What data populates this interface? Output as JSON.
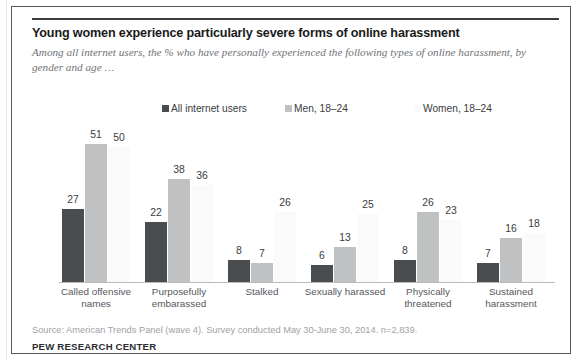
{
  "figure": {
    "title": "Young women experience particularly severe forms of online harassment",
    "subtitle": "Among all internet users, the % who have personally experienced the following types of online harassment, by gender and age …",
    "source": "Source: American Trends Panel (wave 4). Survey conducted May 30-June 30, 2014. n=2,839.",
    "brand": "PEW RESEARCH CENTER"
  },
  "colors": {
    "series_all": "#4a4d50",
    "series_men": "#bfc1c3",
    "series_women": "#fafafa",
    "frame": "#55585c",
    "axis": "#b9bbbd",
    "title_text": "#1a1a1a",
    "subtitle_text": "#6f7276",
    "source_text": "#a0a2a5"
  },
  "chart_data": {
    "type": "bar",
    "title": "Young women experience particularly severe forms of online harassment",
    "subtitle": "Among all internet users, the % who have personally experienced the following types of online harassment, by gender and age …",
    "xlabel": "",
    "ylabel": "",
    "ylim": [
      0,
      58
    ],
    "grid": false,
    "legend_position": "top",
    "categories": [
      "Called offensive names",
      "Purposefully embarassed",
      "Stalked",
      "Sexually harassed",
      "Physically threatened",
      "Sustained harassment"
    ],
    "category_lines": [
      [
        "Called offensive",
        "names"
      ],
      [
        "Purposefully",
        "embarassed"
      ],
      [
        "Stalked"
      ],
      [
        "Sexually harassed"
      ],
      [
        "Physically",
        "threatened"
      ],
      [
        "Sustained",
        "harassment"
      ]
    ],
    "series": [
      {
        "name": "All internet users",
        "color": "#4a4d50",
        "values": [
          27,
          22,
          8,
          6,
          8,
          7
        ]
      },
      {
        "name": "Men, 18–24",
        "color": "#bfc1c3",
        "values": [
          51,
          38,
          7,
          13,
          26,
          16
        ]
      },
      {
        "name": "Women, 18–24",
        "color": "#fafafa",
        "values": [
          50,
          36,
          26,
          25,
          23,
          18
        ]
      }
    ]
  }
}
